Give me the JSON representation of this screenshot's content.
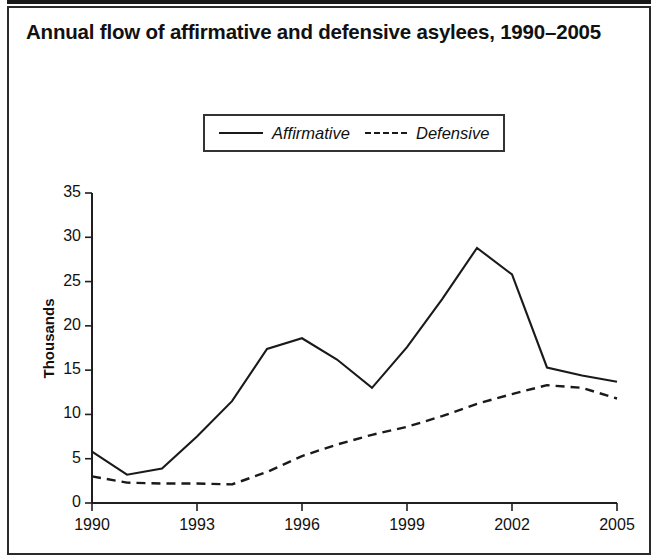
{
  "figure": {
    "title": "Annual flow of affirmative and defensive asylees, 1990–2005"
  },
  "legend": {
    "position": "top-center",
    "entries": [
      {
        "label": "Affirmative",
        "style": "solid",
        "swatch_icon": "solid-line-icon"
      },
      {
        "label": "Defensive",
        "style": "dashed",
        "swatch_icon": "dashed-line-icon"
      }
    ]
  },
  "axes": {
    "ylabel": "Thousands",
    "yticks": [
      "35",
      "30",
      "25",
      "20",
      "15",
      "10",
      "5",
      "0"
    ],
    "xticks": [
      "1990",
      "1993",
      "1996",
      "1999",
      "2002",
      "2005"
    ]
  },
  "chart_data": {
    "type": "line",
    "title": "Annual flow of affirmative and defensive asylees, 1990–2005",
    "xlabel": "",
    "ylabel": "Thousands",
    "xlim": [
      1990,
      2005
    ],
    "ylim": [
      0,
      35
    ],
    "ytick_values": [
      0,
      5,
      10,
      15,
      20,
      25,
      30,
      35
    ],
    "xtick_values": [
      1990,
      1993,
      1996,
      1999,
      2002,
      2005
    ],
    "grid": false,
    "legend_position": "top-center",
    "x": [
      1990,
      1991,
      1992,
      1993,
      1994,
      1995,
      1996,
      1997,
      1998,
      1999,
      2000,
      2001,
      2002,
      2003,
      2004,
      2005
    ],
    "series": [
      {
        "name": "Affirmative",
        "style": "solid",
        "values": [
          5.8,
          3.2,
          3.9,
          7.5,
          11.5,
          17.4,
          18.6,
          16.2,
          13.0,
          17.6,
          23.0,
          28.8,
          25.8,
          15.3,
          14.4,
          13.7
        ]
      },
      {
        "name": "Defensive",
        "style": "dashed",
        "values": [
          3.0,
          2.3,
          2.2,
          2.2,
          2.1,
          3.5,
          5.3,
          6.6,
          7.7,
          8.6,
          9.8,
          11.2,
          12.3,
          13.3,
          13.0,
          11.8
        ]
      }
    ]
  }
}
